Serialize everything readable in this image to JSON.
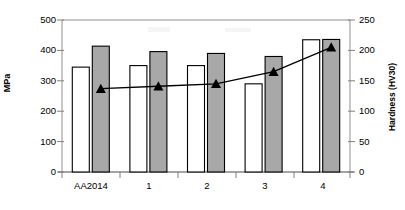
{
  "chart_data": {
    "type": "bar",
    "title": "",
    "subtitle": "",
    "xlabel": "",
    "ylabel": "MPa",
    "ylabel_secondary": "Hardness (HV30)",
    "categories": [
      "AA2014",
      "1",
      "2",
      "3",
      "4"
    ],
    "ylim": [
      0,
      500
    ],
    "ylim_secondary": [
      0,
      250
    ],
    "yticks": [
      0,
      100,
      200,
      300,
      400,
      500
    ],
    "yticks_secondary": [
      0,
      50,
      100,
      150,
      200,
      250
    ],
    "grid": false,
    "legend": "none",
    "series": [
      {
        "name": "Tensile strength",
        "type": "bar",
        "axis": "left",
        "unit": "MPa",
        "fill": "#ffffff",
        "stroke": "#000000",
        "values": [
          345,
          350,
          350,
          290,
          435
        ]
      },
      {
        "name": "Hardness (bar)",
        "type": "bar",
        "axis": "right",
        "unit": "HV30",
        "fill": "#a8a8a8",
        "stroke": "#000000",
        "values": [
          207,
          198,
          195,
          190,
          218
        ]
      },
      {
        "name": "Hardness (line)",
        "type": "line",
        "axis": "right",
        "unit": "HV30",
        "marker": "triangle",
        "stroke": "#000000",
        "values": [
          137,
          141,
          145,
          165,
          205
        ]
      }
    ]
  },
  "axes": {
    "left": {
      "label": "MPa",
      "ticks": [
        "500",
        "400",
        "300",
        "200",
        "100",
        "0"
      ]
    },
    "right": {
      "label": "Hardness (HV30)",
      "ticks": [
        "250",
        "200",
        "150",
        "100",
        "50",
        "0"
      ]
    },
    "x": {
      "categories": [
        "AA2014",
        "1",
        "2",
        "3",
        "4"
      ]
    }
  },
  "colors": {
    "bar_white_fill": "#ffffff",
    "bar_gray_fill": "#a8a8a8",
    "outline": "#000000",
    "line": "#000000",
    "frame": "#808080",
    "background": "#ffffff"
  }
}
